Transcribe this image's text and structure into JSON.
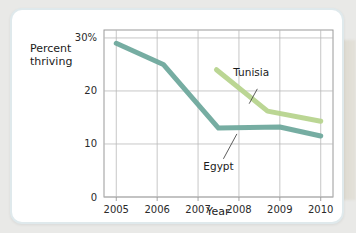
{
  "chart_data": {
    "type": "line",
    "title": "",
    "xlabel": "Year",
    "ylabel": "Percent thriving",
    "ylabel_line1": "Percent",
    "ylabel_line2": "thriving",
    "x": [
      2005,
      2006,
      2007,
      2008,
      2009,
      2010
    ],
    "xticklabels": [
      "2005",
      "2006",
      "2007",
      "2008",
      "2009",
      "2010"
    ],
    "yticklabels": [
      "30%",
      "20",
      "10",
      "0"
    ],
    "ytickvalues": [
      30,
      20,
      10,
      0
    ],
    "xlim": [
      2004.7,
      2010.3
    ],
    "ylim": [
      0,
      31.5
    ],
    "grid": true,
    "legend_position": "inline-annotations",
    "series": [
      {
        "name": "Egypt",
        "color": "#6fa99d",
        "label_text": "Egypt",
        "points": [
          {
            "x": 2005.0,
            "y": 29.0
          },
          {
            "x": 2006.15,
            "y": 25.0
          },
          {
            "x": 2007.5,
            "y": 13.0
          },
          {
            "x": 2009.0,
            "y": 13.2
          },
          {
            "x": 2010.0,
            "y": 11.5
          }
        ]
      },
      {
        "name": "Tunisia",
        "color": "#b7d48e",
        "label_text": "Tunisia",
        "points": [
          {
            "x": 2007.45,
            "y": 24.0
          },
          {
            "x": 2008.7,
            "y": 16.2
          },
          {
            "x": 2010.0,
            "y": 14.3
          }
        ]
      }
    ],
    "annotations": [
      {
        "text": "Tunisia",
        "series": "Tunisia",
        "leader": true
      },
      {
        "text": "Egypt",
        "series": "Egypt",
        "leader": true
      }
    ]
  },
  "axes": {
    "x_title": "Year",
    "y_title_line1": "Percent",
    "y_title_line2": "thriving"
  }
}
